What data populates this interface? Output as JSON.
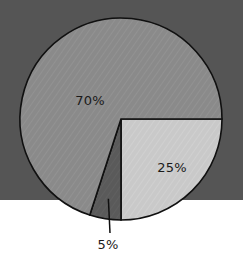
{
  "chart_data": {
    "type": "pie",
    "title": "",
    "subtitle": "",
    "xlabel": "",
    "ylabel": "",
    "legend_position": "none",
    "grid": false,
    "categories": [
      "70%",
      "25%",
      "5%"
    ],
    "values": [
      70,
      25,
      5
    ],
    "labels": [
      "70%",
      "25%",
      "5%"
    ],
    "slices": [
      {
        "label": "70%",
        "value": 70,
        "color": "#8a8a8a",
        "label_placement": "inside",
        "label_x": 90,
        "label_y": 101
      },
      {
        "label": "25%",
        "value": 25,
        "color": "#c9c9c9",
        "label_placement": "inside",
        "label_x": 172,
        "label_y": 168
      },
      {
        "label": "5%",
        "value": 5,
        "color": "#5a5a5a",
        "label_placement": "callout",
        "label_x": 108,
        "label_y": 245
      }
    ],
    "start_angle_deg": 0,
    "direction": "clockwise",
    "center_x": 121,
    "center_y": 119,
    "radius": 101
  },
  "canvas": {
    "width": 243,
    "height": 264,
    "background_top_color": "#555555",
    "background_bottom_color": "#ffffff",
    "band_split_y": 200
  },
  "style": {
    "outline_color": "#101010",
    "outline_width": 1.6,
    "label_text_color": "#1a1a1a",
    "hatch_color": "#ffffff",
    "leader_line_color": "#101010"
  },
  "labels": {
    "slice_major": "70%",
    "slice_medium": "25%",
    "slice_minor": "5%"
  }
}
